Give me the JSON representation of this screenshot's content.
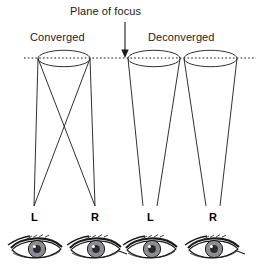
{
  "figure": {
    "type": "diagram",
    "title": "Plane of focus",
    "groups": [
      {
        "label": "Converged",
        "label_x": 30,
        "label_y": 33
      },
      {
        "label": "Deconverged",
        "label_x": 148,
        "label_y": 33
      }
    ],
    "plane_of_focus": {
      "label": "Plane of focus",
      "label_x": 70,
      "label_y": 6,
      "line_y": 58,
      "line_x_start": 24,
      "line_x_end": 256,
      "arrow_x": 125,
      "arrow_top": 22,
      "arrow_bottom": 57,
      "style": "dotted"
    },
    "eyes": [
      {
        "label": "L",
        "label_x": 34,
        "label_y": 212,
        "eye_cx": 37,
        "eye_cy": 250,
        "group": "Converged"
      },
      {
        "label": "R",
        "label_x": 95,
        "label_y": 212,
        "eye_cx": 96,
        "eye_cy": 250,
        "group": "Converged"
      },
      {
        "label": "L",
        "label_x": 150,
        "label_y": 212,
        "eye_cx": 152,
        "eye_cy": 250,
        "group": "Deconverged"
      },
      {
        "label": "R",
        "label_x": 213,
        "label_y": 212,
        "eye_cx": 214,
        "eye_cy": 250,
        "group": "Deconverged"
      }
    ],
    "cones": [
      {
        "name": "converged-left-cone",
        "top_left_x": 38,
        "top_right_x": 90,
        "apex_x": 34,
        "top_y": 58,
        "apex_y": 206,
        "crossed": true
      },
      {
        "name": "converged-right-cone",
        "top_left_x": 38,
        "top_right_x": 90,
        "apex_x": 95,
        "top_y": 58,
        "apex_y": 206,
        "crossed": true
      },
      {
        "name": "deconverged-left-cone",
        "top_left_x": 128,
        "top_right_x": 180,
        "apex_x": 150,
        "top_y": 58,
        "apex_y": 206,
        "crossed": false
      },
      {
        "name": "deconverged-right-cone",
        "top_left_x": 184,
        "top_right_x": 237,
        "apex_x": 213,
        "top_y": 58,
        "apex_y": 206,
        "crossed": false
      }
    ],
    "colors": {
      "stroke": "#1a1a1a",
      "background": "#ffffff",
      "iris": "#8c8c92",
      "pupil": "#2a2a2e",
      "sclera": "#ffffff"
    }
  }
}
